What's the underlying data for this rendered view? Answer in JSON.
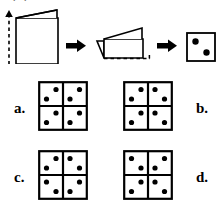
{
  "page": {
    "cut_off_heading": "A paper is folded and then cut as shown",
    "background_color": "#ffffff",
    "ink_color": "#000000"
  },
  "sequence": {
    "name": "paper-folding-sequence",
    "steps": [
      {
        "id": "step-1",
        "label": "open-paper-with-fold-line",
        "fold_line": "dashed-vertical-left",
        "arrow": "down-arrow-on-fold-line"
      },
      {
        "id": "arrow-1",
        "label": "right-arrow"
      },
      {
        "id": "step-2",
        "label": "paper-folded-once",
        "fold_line": "dashed-horizontal-bottom"
      },
      {
        "id": "arrow-2",
        "label": "right-arrow"
      },
      {
        "id": "step-3",
        "label": "folded-square-with-holes",
        "holes": [
          {
            "position": "upper-left"
          },
          {
            "position": "lower-right"
          }
        ]
      }
    ]
  },
  "options": [
    {
      "key": "a",
      "label": "a.",
      "name": "option-a",
      "quadrants": [
        {
          "name": "top-left",
          "dots": [
            "top-right",
            "bottom-left"
          ]
        },
        {
          "name": "top-right",
          "dots": [
            "top-right",
            "bottom-left"
          ]
        },
        {
          "name": "bottom-left",
          "dots": [
            "top-right",
            "bottom-left"
          ]
        },
        {
          "name": "bottom-right",
          "dots": [
            "top-right",
            "bottom-left"
          ]
        }
      ]
    },
    {
      "key": "b",
      "label": "b.",
      "name": "option-b",
      "quadrants": [
        {
          "name": "top-left",
          "dots": [
            "top-right",
            "bottom-left"
          ]
        },
        {
          "name": "top-right",
          "dots": [
            "top-left",
            "bottom-right"
          ]
        },
        {
          "name": "bottom-left",
          "dots": [
            "top-right",
            "bottom-left"
          ]
        },
        {
          "name": "bottom-right",
          "dots": [
            "top-left",
            "bottom-right"
          ]
        }
      ]
    },
    {
      "key": "c",
      "label": "c.",
      "name": "option-c",
      "quadrants": [
        {
          "name": "top-left",
          "dots": [
            "top-right",
            "bottom-left"
          ]
        },
        {
          "name": "top-right",
          "dots": [
            "top-left",
            "bottom-right"
          ]
        },
        {
          "name": "bottom-left",
          "dots": [
            "top-left",
            "bottom-right"
          ]
        },
        {
          "name": "bottom-right",
          "dots": [
            "top-right",
            "bottom-left"
          ]
        }
      ]
    },
    {
      "key": "d",
      "label": "d.",
      "name": "option-d",
      "quadrants": [
        {
          "name": "top-left",
          "dots": [
            "top-left",
            "bottom-right"
          ]
        },
        {
          "name": "top-right",
          "dots": [
            "top-right",
            "bottom-left"
          ]
        },
        {
          "name": "bottom-left",
          "dots": [
            "top-right",
            "bottom-left"
          ]
        },
        {
          "name": "bottom-right",
          "dots": [
            "top-left",
            "bottom-right"
          ]
        }
      ]
    }
  ]
}
